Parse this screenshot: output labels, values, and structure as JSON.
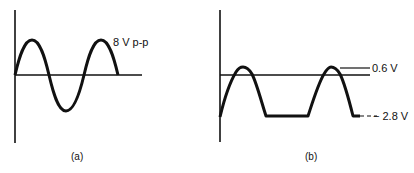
{
  "figure": {
    "panels": [
      {
        "id": "a",
        "caption": "(a)",
        "annotation": "8 V p-p",
        "waveform": "full sine wave, two positive half-cycles, one negative half-cycle"
      },
      {
        "id": "b",
        "caption": "(b)",
        "annotation_top": "0.6 V",
        "annotation_bottom": "− 2.8 V",
        "waveform": "clipped sine wave, positive peaks at +0.6 V, negative clipped flat at -2.8 V"
      }
    ]
  }
}
